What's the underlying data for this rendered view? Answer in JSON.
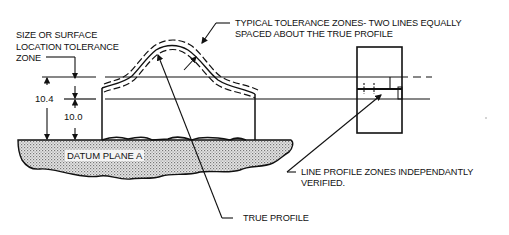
{
  "diagram": {
    "labels": {
      "size_zone_line1": "SIZE OR SURFACE",
      "size_zone_line2": "LOCATION TOLERANCE",
      "size_zone_line3": "ZONE",
      "typical_line1": "TYPICAL TOLERANCE ZONES- TWO LINES EQUALLY",
      "typical_line2": "SPACED ABOUT THE TRUE PROFILE",
      "independent_line1": "LINE PROFILE ZONES INDEPENDANTLY",
      "independent_line2": "VERIFIED.",
      "true_profile": "TRUE PROFILE",
      "datum": "DATUM PLANE  A"
    },
    "dimensions": {
      "upper": "10.4",
      "lower": "10.0"
    },
    "colors": {
      "line": "#111111",
      "datum_fill": "#cfcfcf",
      "background": "#ffffff"
    }
  }
}
